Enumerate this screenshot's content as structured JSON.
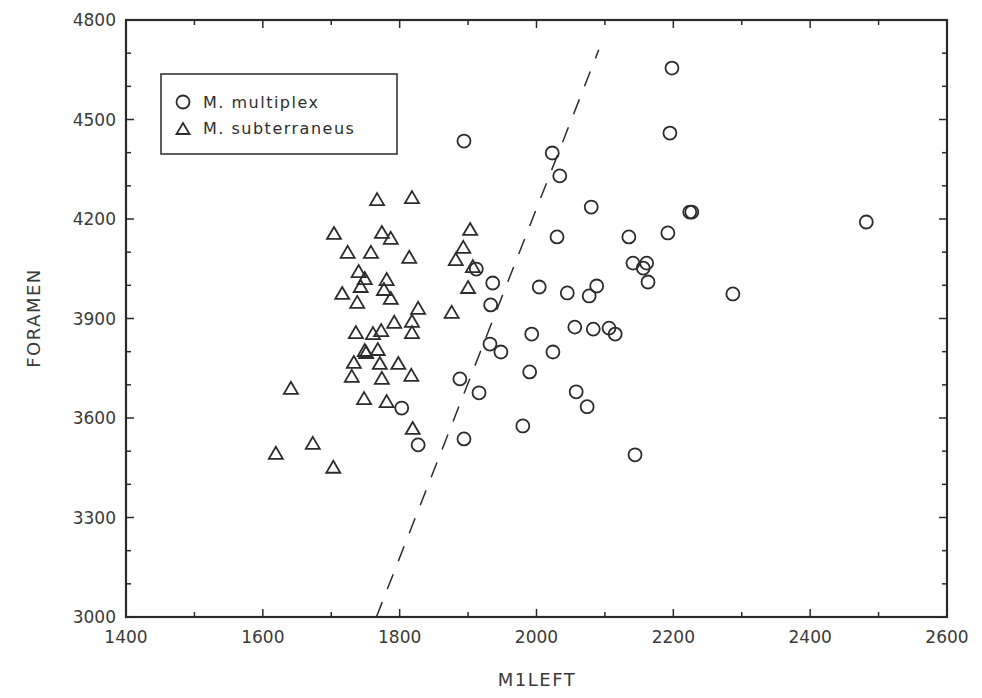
{
  "chart_data": {
    "type": "scatter",
    "title": "",
    "xlabel": "M1LEFT",
    "ylabel": "FORAMEN",
    "xlim": [
      1400,
      2600
    ],
    "ylim": [
      3000,
      4800
    ],
    "xticks": [
      1400,
      1600,
      1800,
      2000,
      2200,
      2400,
      2600
    ],
    "yticks": [
      3000,
      3300,
      3600,
      3900,
      4200,
      4500,
      4800
    ],
    "x_minor_step": 100,
    "y_minor_step": 100,
    "grid": false,
    "legend_position": "upper-left",
    "series": [
      {
        "name": "M. multiplex",
        "marker": "circle",
        "points": [
          [
            1894,
            4435
          ],
          [
            2023,
            4399
          ],
          [
            2034,
            4330
          ],
          [
            2198,
            4655
          ],
          [
            2195,
            4459
          ],
          [
            2080,
            4236
          ],
          [
            2030,
            4146
          ],
          [
            2227,
            4221
          ],
          [
            2224,
            4221
          ],
          [
            2482,
            4191
          ],
          [
            2135,
            4146
          ],
          [
            2192,
            4158
          ],
          [
            2141,
            4067
          ],
          [
            2161,
            4067
          ],
          [
            2156,
            4052
          ],
          [
            2163,
            4010
          ],
          [
            1912,
            4049
          ],
          [
            1936,
            4007
          ],
          [
            2004,
            3995
          ],
          [
            2045,
            3977
          ],
          [
            2088,
            3998
          ],
          [
            2077,
            3968
          ],
          [
            1933,
            3941
          ],
          [
            2056,
            3874
          ],
          [
            2083,
            3868
          ],
          [
            2106,
            3871
          ],
          [
            2115,
            3853
          ],
          [
            2287,
            3974
          ],
          [
            1932,
            3823
          ],
          [
            1948,
            3799
          ],
          [
            1993,
            3853
          ],
          [
            2024,
            3799
          ],
          [
            1990,
            3739
          ],
          [
            1888,
            3718
          ],
          [
            1916,
            3676
          ],
          [
            2058,
            3679
          ],
          [
            2074,
            3634
          ],
          [
            1803,
            3630
          ],
          [
            1980,
            3576
          ],
          [
            1827,
            3519
          ],
          [
            1894,
            3537
          ],
          [
            2144,
            3489
          ]
        ]
      },
      {
        "name": "M. subterraneus",
        "marker": "triangle",
        "points": [
          [
            1767,
            4257
          ],
          [
            1818,
            4263
          ],
          [
            1704,
            4155
          ],
          [
            1774,
            4158
          ],
          [
            1787,
            4140
          ],
          [
            1724,
            4098
          ],
          [
            1758,
            4098
          ],
          [
            1814,
            4083
          ],
          [
            1903,
            4167
          ],
          [
            1893,
            4113
          ],
          [
            1882,
            4076
          ],
          [
            1907,
            4055
          ],
          [
            1740,
            4040
          ],
          [
            1749,
            4019
          ],
          [
            1743,
            3995
          ],
          [
            1781,
            4016
          ],
          [
            1777,
            3986
          ],
          [
            1716,
            3974
          ],
          [
            1787,
            3959
          ],
          [
            1738,
            3947
          ],
          [
            1900,
            3992
          ],
          [
            1827,
            3929
          ],
          [
            1876,
            3917
          ],
          [
            1818,
            3890
          ],
          [
            1792,
            3887
          ],
          [
            1818,
            3856
          ],
          [
            1773,
            3862
          ],
          [
            1761,
            3853
          ],
          [
            1736,
            3856
          ],
          [
            1749,
            3802
          ],
          [
            1751,
            3796
          ],
          [
            1768,
            3805
          ],
          [
            1733,
            3766
          ],
          [
            1771,
            3763
          ],
          [
            1798,
            3763
          ],
          [
            1730,
            3724
          ],
          [
            1774,
            3718
          ],
          [
            1817,
            3727
          ],
          [
            1748,
            3657
          ],
          [
            1781,
            3648
          ],
          [
            1641,
            3688
          ],
          [
            1819,
            3567
          ],
          [
            1673,
            3522
          ],
          [
            1619,
            3492
          ],
          [
            1703,
            3450
          ]
        ]
      }
    ],
    "annotations": [
      {
        "type": "dashed-line",
        "label": "discriminant line",
        "from": [
          1766,
          3000
        ],
        "to": [
          2091,
          4710
        ]
      }
    ]
  },
  "legend": {
    "items": [
      {
        "label": "M. multiplex",
        "marker": "circle"
      },
      {
        "label": "M. subterraneus",
        "marker": "triangle"
      }
    ]
  },
  "axes": {
    "x_title": "M1LEFT",
    "y_title": "FORAMEN"
  }
}
